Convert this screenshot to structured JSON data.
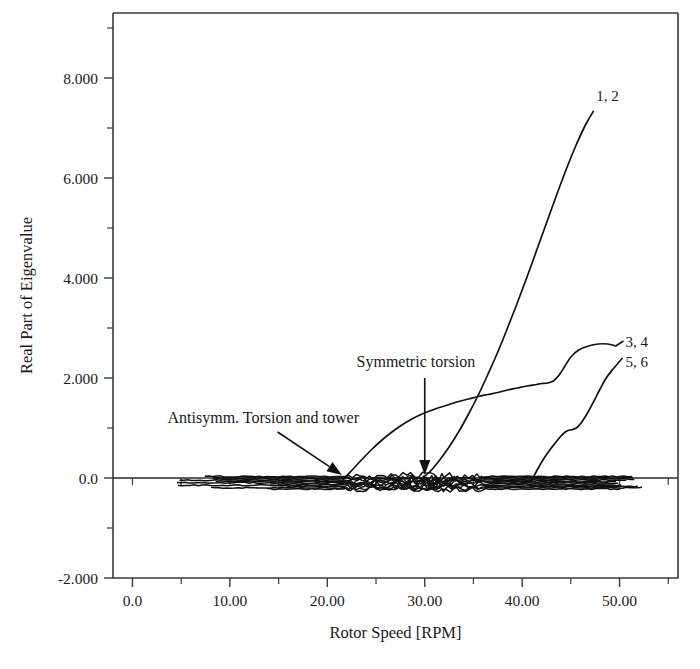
{
  "chart_data": {
    "type": "line",
    "title": "",
    "xlabel": "Rotor Speed [RPM]",
    "ylabel": "Real Part of Eigenvalue",
    "xlim": [
      -2.0,
      56.0
    ],
    "ylim": [
      -2.0,
      9.3
    ],
    "grid": false,
    "legend": "inline-curve-end-labels",
    "xticks": [
      0.0,
      10.0,
      20.0,
      30.0,
      40.0,
      50.0
    ],
    "xtick_labels": [
      "0.0",
      "10.00",
      "20.00",
      "30.00",
      "40.00",
      "50.00"
    ],
    "x_minor_ticks": [
      5.0,
      15.0,
      25.0,
      35.0,
      45.0,
      55.0
    ],
    "yticks": [
      -2.0,
      0.0,
      2.0,
      4.0,
      6.0,
      8.0
    ],
    "ytick_labels": [
      "-2.000",
      "0.0",
      "2.000",
      "4.000",
      "6.000",
      "8.000"
    ],
    "y_minor_ticks": [
      -1.0,
      1.0,
      3.0,
      5.0,
      7.0,
      9.0
    ],
    "series": [
      {
        "name": "1, 2",
        "label": "1, 2",
        "label_x": 47.6,
        "label_y": 7.55,
        "points": [
          [
            29.6,
            -0.02
          ],
          [
            30.5,
            0.12
          ],
          [
            31.5,
            0.35
          ],
          [
            32.5,
            0.62
          ],
          [
            33.5,
            0.93
          ],
          [
            34.5,
            1.28
          ],
          [
            35.5,
            1.66
          ],
          [
            36.5,
            2.08
          ],
          [
            37.5,
            2.52
          ],
          [
            38.5,
            3.0
          ],
          [
            39.5,
            3.5
          ],
          [
            40.5,
            4.02
          ],
          [
            41.5,
            4.56
          ],
          [
            42.5,
            5.1
          ],
          [
            43.5,
            5.64
          ],
          [
            44.5,
            6.16
          ],
          [
            45.5,
            6.64
          ],
          [
            46.5,
            7.06
          ],
          [
            47.3,
            7.33
          ]
        ]
      },
      {
        "name": "3, 4",
        "label": "3, 4",
        "label_x": 50.6,
        "label_y": 2.62,
        "points": [
          [
            21.6,
            -0.04
          ],
          [
            22.5,
            0.15
          ],
          [
            23.5,
            0.36
          ],
          [
            24.5,
            0.56
          ],
          [
            25.5,
            0.74
          ],
          [
            26.5,
            0.9
          ],
          [
            27.5,
            1.04
          ],
          [
            28.5,
            1.16
          ],
          [
            29.5,
            1.26
          ],
          [
            30.5,
            1.34
          ],
          [
            31.5,
            1.41
          ],
          [
            32.5,
            1.47
          ],
          [
            33.5,
            1.53
          ],
          [
            34.5,
            1.58
          ],
          [
            35.5,
            1.63
          ],
          [
            36.5,
            1.67
          ],
          [
            37.5,
            1.71
          ],
          [
            38.5,
            1.76
          ],
          [
            39.5,
            1.8
          ],
          [
            40.5,
            1.84
          ],
          [
            41.5,
            1.87
          ],
          [
            42.0,
            1.89
          ],
          [
            42.6,
            1.9
          ],
          [
            43.2,
            1.94
          ],
          [
            43.8,
            2.06
          ],
          [
            44.4,
            2.24
          ],
          [
            45.0,
            2.42
          ],
          [
            45.8,
            2.56
          ],
          [
            46.8,
            2.64
          ],
          [
            47.8,
            2.68
          ],
          [
            48.8,
            2.68
          ],
          [
            49.6,
            2.64
          ]
        ]
      },
      {
        "name": "5, 6",
        "label": "5, 6",
        "label_x": 50.6,
        "label_y": 2.22,
        "points": [
          [
            40.9,
            -0.08
          ],
          [
            41.6,
            0.18
          ],
          [
            42.2,
            0.38
          ],
          [
            42.8,
            0.55
          ],
          [
            43.4,
            0.7
          ],
          [
            43.9,
            0.82
          ],
          [
            44.3,
            0.9
          ],
          [
            44.7,
            0.95
          ],
          [
            45.2,
            0.97
          ],
          [
            45.7,
            1.02
          ],
          [
            46.2,
            1.14
          ],
          [
            46.8,
            1.33
          ],
          [
            47.4,
            1.55
          ],
          [
            48.0,
            1.78
          ],
          [
            48.6,
            1.99
          ],
          [
            49.2,
            2.15
          ]
        ]
      }
    ],
    "baseline_cluster": {
      "description": "Dense band of near-zero real-part eigenvalue traces running along y=0 from roughly 4 to 52 RPM",
      "y_range": [
        -0.22,
        0.03
      ],
      "x_range": [
        4.0,
        52.5
      ]
    },
    "annotations": [
      {
        "text": "Antisymm. Torsion and tower",
        "text_x": 3.6,
        "text_y": 1.1,
        "arrow_from_x": 14.9,
        "arrow_from_y": 0.92,
        "arrow_to_x": 21.5,
        "arrow_to_y": 0.06
      },
      {
        "text": "Symmetric torsion",
        "text_x": 23.0,
        "text_y": 2.22,
        "arrow_from_x": 30.0,
        "arrow_from_y": 2.0,
        "arrow_to_x": 30.0,
        "arrow_to_y": 0.06
      }
    ],
    "curve_leaders": [
      {
        "for": "3, 4",
        "from_x": 49.6,
        "from_y": 2.64,
        "to_x": 50.4,
        "to_y": 2.74
      },
      {
        "for": "5, 6",
        "from_x": 49.2,
        "from_y": 2.15,
        "to_x": 50.3,
        "to_y": 2.4
      }
    ],
    "colors": {
      "background": "#ffffff",
      "curve": "#111111",
      "axis": "#3a3a3a",
      "text": "#1a1a1a"
    }
  }
}
